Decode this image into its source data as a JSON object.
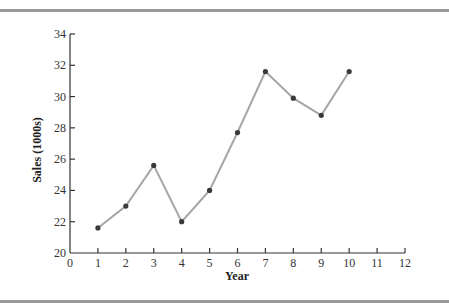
{
  "chart_data": {
    "type": "line",
    "title": "",
    "xlabel": "Year",
    "ylabel": "Sales (1000s)",
    "x": [
      1,
      2,
      3,
      4,
      5,
      6,
      7,
      8,
      9,
      10
    ],
    "series": [
      {
        "name": "Sales",
        "values": [
          21.6,
          23.0,
          25.6,
          22.0,
          24.0,
          27.7,
          31.6,
          29.9,
          28.8,
          31.6
        ]
      }
    ],
    "xlim": [
      0,
      12
    ],
    "ylim": [
      20,
      34
    ],
    "xticks": [
      "0",
      "1",
      "2",
      "3",
      "4",
      "5",
      "6",
      "7",
      "8",
      "9",
      "10",
      "11",
      "12"
    ],
    "yticks": [
      "20",
      "22",
      "24",
      "26",
      "28",
      "30",
      "32",
      "34"
    ],
    "grid": false,
    "legend": null,
    "colors": {
      "line": "#a6a6a6",
      "marker": "#3a3a3a",
      "axis": "#333333",
      "rule": "#9a9a9a"
    }
  }
}
